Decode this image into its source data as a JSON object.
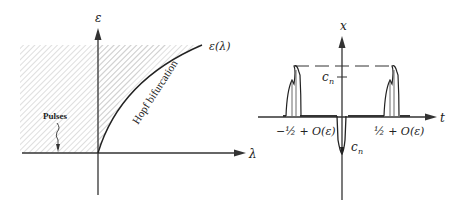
{
  "left_diagram": {
    "y_axis_label": "ε",
    "x_axis_label": "λ",
    "curve_label": "ε(λ)",
    "curve_annotation": "Hopf bifurcation",
    "region_label": "Pulses"
  },
  "right_diagram": {
    "y_axis_label": "x",
    "x_axis_label": "t",
    "upper_level_label": "c",
    "upper_level_sub": "n",
    "lower_level_label": "c",
    "lower_level_sub": "n",
    "left_tick": "−½ + O(ε)",
    "right_tick": "½ + O(ε)"
  }
}
